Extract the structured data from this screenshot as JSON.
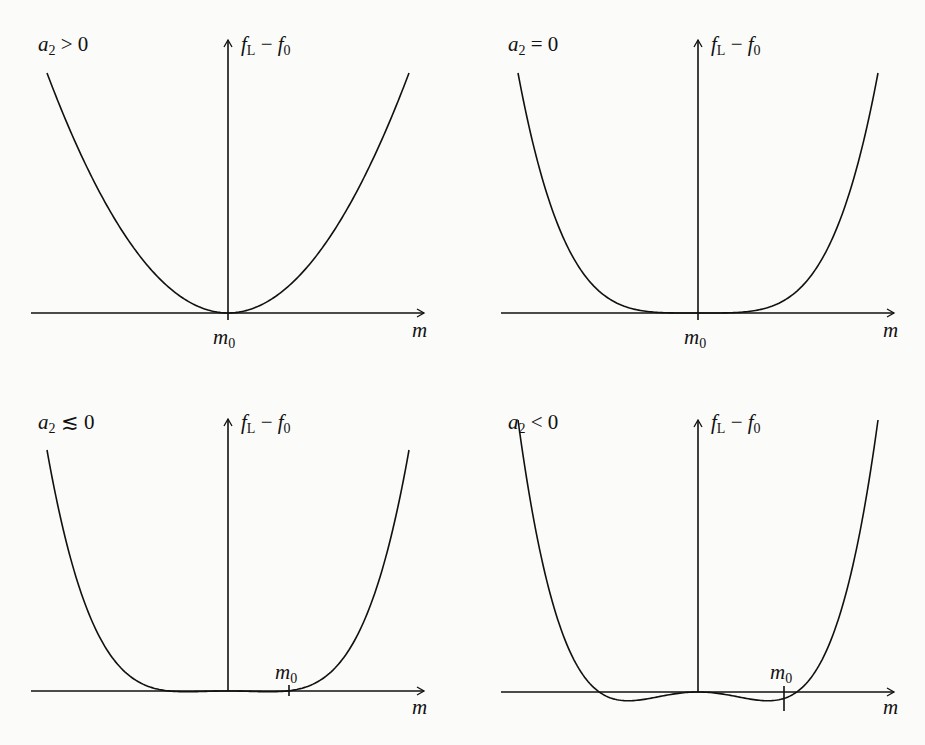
{
  "panels": [
    {
      "id": "a2-positive",
      "condition": "a₂ > 0",
      "cond_var": "a",
      "cond_sub": "2",
      "cond_rel": " > 0",
      "y_label": "f_L − f_0",
      "x_label": "m",
      "min_label": "m₀"
    },
    {
      "id": "a2-zero",
      "condition": "a₂ = 0",
      "cond_var": "a",
      "cond_sub": "2",
      "cond_rel": " = 0",
      "y_label": "f_L − f_0",
      "x_label": "m",
      "min_label": "m₀"
    },
    {
      "id": "a2-slightly-negative",
      "condition": "a₂ ≲ 0",
      "cond_var": "a",
      "cond_sub": "2",
      "cond_rel": " ≲ 0",
      "y_label": "f_L − f_0",
      "x_label": "m",
      "min_label": "m₀"
    },
    {
      "id": "a2-negative",
      "condition": "a₂ < 0",
      "cond_var": "a",
      "cond_sub": "2",
      "cond_rel": " < 0",
      "y_label": "f_L − f_0",
      "x_label": "m",
      "min_label": "m₀"
    }
  ],
  "labels": {
    "y_f": "f",
    "y_fsub": "L",
    "y_minus": " − ",
    "y_f0": "f",
    "y_f0sub": "0",
    "x": "m",
    "m": "m",
    "msub": "0"
  },
  "chart_data": [
    {
      "type": "line",
      "title": "a₂ > 0",
      "xlabel": "m",
      "ylabel": "f_L − f_0",
      "description": "Parabola-like curve with single minimum at m = m₀ = 0",
      "x": [
        -1,
        -0.5,
        0,
        0.5,
        1
      ],
      "y": [
        1,
        0.25,
        0,
        0.25,
        1
      ],
      "minimum": {
        "x": 0,
        "label": "m₀"
      }
    },
    {
      "type": "line",
      "title": "a₂ = 0",
      "xlabel": "m",
      "ylabel": "f_L − f_0",
      "description": "Quartic curve, flat near minimum at m = m₀ = 0",
      "x": [
        -1,
        -0.5,
        0,
        0.5,
        1
      ],
      "y": [
        1,
        0.0625,
        0,
        0.0625,
        1
      ],
      "minimum": {
        "x": 0,
        "label": "m₀"
      }
    },
    {
      "type": "line",
      "title": "a₂ ≲ 0",
      "xlabel": "m",
      "ylabel": "f_L − f_0",
      "description": "Double-well with very shallow minima at ±m₀ ≈ ±0.34",
      "x": [
        -1,
        -0.5,
        -0.34,
        0,
        0.34,
        0.5,
        1
      ],
      "y": [
        1,
        0.02,
        -0.01,
        0,
        -0.01,
        0.02,
        1
      ],
      "minimum": {
        "x": 0.34,
        "label": "m₀"
      }
    },
    {
      "type": "line",
      "title": "a₂ < 0",
      "xlabel": "m",
      "ylabel": "f_L − f_0",
      "description": "Double-well with distinct minima at ±m₀ ≈ ±0.48, local max at 0",
      "x": [
        -1,
        -0.66,
        -0.48,
        0,
        0.48,
        0.66,
        1
      ],
      "y": [
        1,
        0,
        -0.08,
        0,
        -0.08,
        0,
        1
      ],
      "minimum": {
        "x": 0.48,
        "label": "m₀"
      }
    }
  ]
}
